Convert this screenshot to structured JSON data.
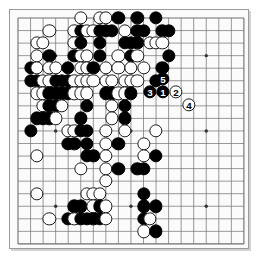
{
  "app": {
    "title": "Go Board Diagram",
    "board_size": 19,
    "background_color": "#fbfbfb",
    "line_color": "#6e6e6e",
    "border_color": "#9a9a9a",
    "black_color": "#000000",
    "white_color": "#ffffff"
  },
  "board": {
    "size": 19,
    "origin_x": 8,
    "origin_y": 8,
    "spacing": 12.55,
    "star_points": [
      [
        3,
        3
      ],
      [
        9,
        3
      ],
      [
        15,
        3
      ],
      [
        3,
        9
      ],
      [
        9,
        9
      ],
      [
        15,
        9
      ],
      [
        3,
        15
      ],
      [
        9,
        15
      ],
      [
        15,
        15
      ]
    ],
    "stones": [
      {
        "c": 10,
        "r": 0,
        "color": "white"
      },
      {
        "c": 13,
        "r": 0,
        "color": "white"
      },
      {
        "c": 14,
        "r": 0,
        "color": "white"
      },
      {
        "c": 16,
        "r": 0,
        "color": "black"
      },
      {
        "c": 19,
        "r": 0,
        "color": "black"
      },
      {
        "c": 22,
        "r": 0,
        "color": "black"
      },
      {
        "c": 5,
        "r": 1,
        "color": "white"
      },
      {
        "c": 9,
        "r": 1,
        "color": "white"
      },
      {
        "c": 10,
        "r": 1,
        "color": "black"
      },
      {
        "c": 11,
        "r": 1,
        "color": "white"
      },
      {
        "c": 12,
        "r": 1,
        "color": "white"
      },
      {
        "c": 13,
        "r": 1,
        "color": "black"
      },
      {
        "c": 14,
        "r": 1,
        "color": "black"
      },
      {
        "c": 15,
        "r": 1,
        "color": "black"
      },
      {
        "c": 17,
        "r": 1,
        "color": "white"
      },
      {
        "c": 19,
        "r": 1,
        "color": "black"
      },
      {
        "c": 20,
        "r": 1,
        "color": "black"
      },
      {
        "c": 23,
        "r": 1,
        "color": "black"
      },
      {
        "c": 24,
        "r": 1,
        "color": "black"
      },
      {
        "c": 3,
        "r": 2,
        "color": "white"
      },
      {
        "c": 4,
        "r": 2,
        "color": "white"
      },
      {
        "c": 9,
        "r": 2,
        "color": "white"
      },
      {
        "c": 10,
        "r": 2,
        "color": "black"
      },
      {
        "c": 13,
        "r": 2,
        "color": "black"
      },
      {
        "c": 17,
        "r": 2,
        "color": "black"
      },
      {
        "c": 18,
        "r": 2,
        "color": "black"
      },
      {
        "c": 19,
        "r": 2,
        "color": "black"
      },
      {
        "c": 21,
        "r": 2,
        "color": "white"
      },
      {
        "c": 22,
        "r": 2,
        "color": "white"
      },
      {
        "c": 23,
        "r": 2,
        "color": "white"
      },
      {
        "c": 3,
        "r": 3,
        "color": "white"
      },
      {
        "c": 5,
        "r": 3,
        "color": "black"
      },
      {
        "c": 9,
        "r": 3,
        "color": "black"
      },
      {
        "c": 10,
        "r": 3,
        "color": "white"
      },
      {
        "c": 11,
        "r": 3,
        "color": "white"
      },
      {
        "c": 13,
        "r": 3,
        "color": "black"
      },
      {
        "c": 16,
        "r": 3,
        "color": "white"
      },
      {
        "c": 18,
        "r": 3,
        "color": "black"
      },
      {
        "c": 19,
        "r": 3,
        "color": "white"
      },
      {
        "c": 24,
        "r": 3,
        "color": "black"
      },
      {
        "c": 2,
        "r": 4,
        "color": "black"
      },
      {
        "c": 3,
        "r": 4,
        "color": "white"
      },
      {
        "c": 5,
        "r": 4,
        "color": "white"
      },
      {
        "c": 6,
        "r": 4,
        "color": "white"
      },
      {
        "c": 8,
        "r": 4,
        "color": "black"
      },
      {
        "c": 10,
        "r": 4,
        "color": "white"
      },
      {
        "c": 11,
        "r": 4,
        "color": "white"
      },
      {
        "c": 12,
        "r": 4,
        "color": "black"
      },
      {
        "c": 14,
        "r": 4,
        "color": "white"
      },
      {
        "c": 16,
        "r": 4,
        "color": "white"
      },
      {
        "c": 18,
        "r": 4,
        "color": "white"
      },
      {
        "c": 20,
        "r": 4,
        "color": "white"
      },
      {
        "c": 23,
        "r": 4,
        "color": "black"
      },
      {
        "c": 2,
        "r": 5,
        "color": "black"
      },
      {
        "c": 3,
        "r": 5,
        "color": "black"
      },
      {
        "c": 4,
        "r": 5,
        "color": "white"
      },
      {
        "c": 5,
        "r": 5,
        "color": "white"
      },
      {
        "c": 6,
        "r": 5,
        "color": "black"
      },
      {
        "c": 7,
        "r": 5,
        "color": "black"
      },
      {
        "c": 8,
        "r": 5,
        "color": "black"
      },
      {
        "c": 9,
        "r": 5,
        "color": "white"
      },
      {
        "c": 10,
        "r": 5,
        "color": "white"
      },
      {
        "c": 11,
        "r": 5,
        "color": "white"
      },
      {
        "c": 12,
        "r": 5,
        "color": "white"
      },
      {
        "c": 14,
        "r": 5,
        "color": "white"
      },
      {
        "c": 15,
        "r": 5,
        "color": "white"
      },
      {
        "c": 17,
        "r": 5,
        "color": "white"
      },
      {
        "c": 18,
        "r": 5,
        "color": "white"
      },
      {
        "c": 19,
        "r": 5,
        "color": "white"
      },
      {
        "c": 22,
        "r": 5,
        "color": "black"
      },
      {
        "c": 3,
        "r": 6,
        "color": "white"
      },
      {
        "c": 4,
        "r": 6,
        "color": "white"
      },
      {
        "c": 5,
        "r": 6,
        "color": "black"
      },
      {
        "c": 6,
        "r": 6,
        "color": "black"
      },
      {
        "c": 7,
        "r": 6,
        "color": "black"
      },
      {
        "c": 8,
        "r": 6,
        "color": "black"
      },
      {
        "c": 9,
        "r": 6,
        "color": "white"
      },
      {
        "c": 10,
        "r": 6,
        "color": "white"
      },
      {
        "c": 11,
        "r": 6,
        "color": "white"
      },
      {
        "c": 14,
        "r": 6,
        "color": "black"
      },
      {
        "c": 15,
        "r": 6,
        "color": "black"
      },
      {
        "c": 16,
        "r": 6,
        "color": "white"
      },
      {
        "c": 17,
        "r": 6,
        "color": "white"
      },
      {
        "c": 18,
        "r": 6,
        "color": "black"
      },
      {
        "c": 4,
        "r": 7,
        "color": "white"
      },
      {
        "c": 5,
        "r": 7,
        "color": "black"
      },
      {
        "c": 6,
        "r": 7,
        "color": "black"
      },
      {
        "c": 7,
        "r": 7,
        "color": "white"
      },
      {
        "c": 11,
        "r": 7,
        "color": "black"
      },
      {
        "c": 15,
        "r": 7,
        "color": "white"
      },
      {
        "c": 17,
        "r": 7,
        "color": "black"
      },
      {
        "c": 3,
        "r": 8,
        "color": "black"
      },
      {
        "c": 4,
        "r": 8,
        "color": "black"
      },
      {
        "c": 5,
        "r": 8,
        "color": "black"
      },
      {
        "c": 6,
        "r": 8,
        "color": "white"
      },
      {
        "c": 10,
        "r": 8,
        "color": "black"
      },
      {
        "c": 15,
        "r": 8,
        "color": "white"
      },
      {
        "c": 17,
        "r": 8,
        "color": "black"
      },
      {
        "c": 2,
        "r": 9,
        "color": "black"
      },
      {
        "c": 8,
        "r": 9,
        "color": "white"
      },
      {
        "c": 9,
        "r": 9,
        "color": "white"
      },
      {
        "c": 10,
        "r": 9,
        "color": "black"
      },
      {
        "c": 11,
        "r": 9,
        "color": "black"
      },
      {
        "c": 14,
        "r": 9,
        "color": "white"
      },
      {
        "c": 17,
        "r": 9,
        "color": "white"
      },
      {
        "c": 22,
        "r": 9,
        "color": "white"
      },
      {
        "c": 8,
        "r": 10,
        "color": "black"
      },
      {
        "c": 9,
        "r": 10,
        "color": "black"
      },
      {
        "c": 11,
        "r": 10,
        "color": "black"
      },
      {
        "c": 14,
        "r": 10,
        "color": "white"
      },
      {
        "c": 16,
        "r": 10,
        "color": "black"
      },
      {
        "c": 20,
        "r": 10,
        "color": "white"
      },
      {
        "c": 3,
        "r": 11,
        "color": "white"
      },
      {
        "c": 11,
        "r": 11,
        "color": "black"
      },
      {
        "c": 12,
        "r": 11,
        "color": "black"
      },
      {
        "c": 14,
        "r": 11,
        "color": "white"
      },
      {
        "c": 20,
        "r": 11,
        "color": "white"
      },
      {
        "c": 22,
        "r": 11,
        "color": "black"
      },
      {
        "c": 10,
        "r": 12,
        "color": "white"
      },
      {
        "c": 14,
        "r": 12,
        "color": "white"
      },
      {
        "c": 16,
        "r": 12,
        "color": "black"
      },
      {
        "c": 19,
        "r": 12,
        "color": "black"
      },
      {
        "c": 20,
        "r": 12,
        "color": "black"
      },
      {
        "c": 14,
        "r": 13,
        "color": "white"
      },
      {
        "c": 3,
        "r": 14,
        "color": "white"
      },
      {
        "c": 11,
        "r": 14,
        "color": "white"
      },
      {
        "c": 12,
        "r": 14,
        "color": "white"
      },
      {
        "c": 13,
        "r": 14,
        "color": "white"
      },
      {
        "c": 20,
        "r": 14,
        "color": "black"
      },
      {
        "c": 9,
        "r": 15,
        "color": "black"
      },
      {
        "c": 10,
        "r": 15,
        "color": "black"
      },
      {
        "c": 12,
        "r": 15,
        "color": "white"
      },
      {
        "c": 13,
        "r": 15,
        "color": "black"
      },
      {
        "c": 14,
        "r": 15,
        "color": "white"
      },
      {
        "c": 20,
        "r": 15,
        "color": "black"
      },
      {
        "c": 22,
        "r": 15,
        "color": "black"
      },
      {
        "c": 5,
        "r": 16,
        "color": "white"
      },
      {
        "c": 8,
        "r": 16,
        "color": "black"
      },
      {
        "c": 9,
        "r": 16,
        "color": "white"
      },
      {
        "c": 10,
        "r": 16,
        "color": "black"
      },
      {
        "c": 11,
        "r": 16,
        "color": "black"
      },
      {
        "c": 12,
        "r": 16,
        "color": "black"
      },
      {
        "c": 13,
        "r": 16,
        "color": "black"
      },
      {
        "c": 14,
        "r": 16,
        "color": "white"
      },
      {
        "c": 20,
        "r": 16,
        "color": "black"
      },
      {
        "c": 21,
        "r": 16,
        "color": "white"
      },
      {
        "c": 20,
        "r": 17,
        "color": "white"
      },
      {
        "c": 22,
        "r": 17,
        "color": "black"
      }
    ],
    "numbered_moves": [
      {
        "label": "3",
        "color": "black",
        "x": 149,
        "y": 91
      },
      {
        "label": "1",
        "color": "black",
        "x": 162,
        "y": 91
      },
      {
        "label": "2",
        "color": "white",
        "x": 175,
        "y": 91
      },
      {
        "label": "5",
        "color": "black",
        "x": 162,
        "y": 78
      },
      {
        "label": "4",
        "color": "white",
        "x": 188,
        "y": 104
      }
    ]
  }
}
